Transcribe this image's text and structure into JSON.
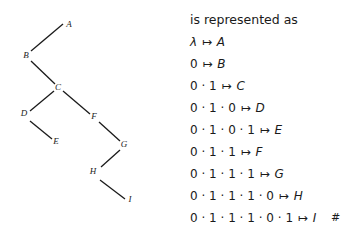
{
  "tree": {
    "nodes": [
      {
        "label": "A",
        "x": 69,
        "y": 25
      },
      {
        "label": "B",
        "x": 26,
        "y": 56
      },
      {
        "label": "C",
        "x": 58,
        "y": 88
      },
      {
        "label": "D",
        "x": 24,
        "y": 114
      },
      {
        "label": "E",
        "x": 56,
        "y": 142
      },
      {
        "label": "F",
        "x": 94,
        "y": 117
      },
      {
        "label": "G",
        "x": 124,
        "y": 145
      },
      {
        "label": "H",
        "x": 93,
        "y": 172
      },
      {
        "label": "I",
        "x": 130,
        "y": 200
      }
    ],
    "edges": [
      {
        "x1": 63,
        "y1": 24,
        "x2": 31,
        "y2": 51
      },
      {
        "x1": 31,
        "y1": 61,
        "x2": 55,
        "y2": 84
      },
      {
        "x1": 54,
        "y1": 91,
        "x2": 30,
        "y2": 111
      },
      {
        "x1": 30,
        "y1": 121,
        "x2": 52,
        "y2": 139
      },
      {
        "x1": 63,
        "y1": 91,
        "x2": 90,
        "y2": 114
      },
      {
        "x1": 99,
        "y1": 122,
        "x2": 120,
        "y2": 141
      },
      {
        "x1": 120,
        "y1": 150,
        "x2": 101,
        "y2": 167
      },
      {
        "x1": 100,
        "y1": 180,
        "x2": 125,
        "y2": 199
      }
    ]
  },
  "representation": {
    "title": "is represented as",
    "rows": [
      {
        "seq": "λ",
        "arrow": "↦",
        "label": "A"
      },
      {
        "seq": "0",
        "arrow": "↦",
        "label": "B"
      },
      {
        "seq": "0 · 1",
        "arrow": "↦",
        "label": "C"
      },
      {
        "seq": "0 · 1 · 0",
        "arrow": "↦",
        "label": "D"
      },
      {
        "seq": "0 · 1 · 0 · 1",
        "arrow": "↦",
        "label": "E"
      },
      {
        "seq": "0 · 1 · 1",
        "arrow": "↦",
        "label": "F"
      },
      {
        "seq": "0 · 1 · 1 · 1",
        "arrow": "↦",
        "label": "G"
      },
      {
        "seq": "0 · 1 · 1 · 1 · 0",
        "arrow": "↦",
        "label": "H"
      },
      {
        "seq": "0 · 1 · 1 · 1 · 0 · 1",
        "arrow": "↦",
        "label": "I",
        "end": "#"
      }
    ]
  }
}
